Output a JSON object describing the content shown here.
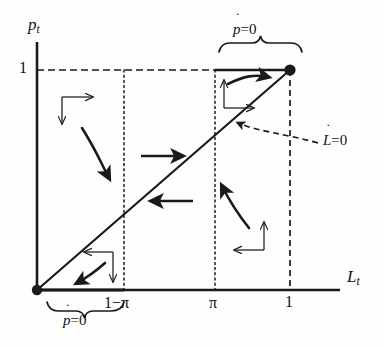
{
  "figure": {
    "type": "phase-diagram",
    "axes": {
      "x_label": "L",
      "x_label_sub": "t",
      "y_label": "p",
      "y_label_sub": "t"
    },
    "x_ticks": [
      {
        "label": "1−π",
        "value": "1-pi"
      },
      {
        "label": "π",
        "value": "pi"
      },
      {
        "label": "1",
        "value": "1"
      }
    ],
    "y_ticks": [
      {
        "label": "1",
        "value": "1"
      }
    ],
    "annotations": {
      "p_dot_top": {
        "base": "p",
        "dot": "˙",
        "rest": "=0"
      },
      "p_dot_bottom": {
        "base": "p",
        "dot": "˙",
        "rest": "=0"
      },
      "l_dot": {
        "base": "L",
        "dot": "˙",
        "rest": "=0"
      }
    },
    "nodes": [
      {
        "name": "origin-node",
        "x": "0",
        "y": "0"
      },
      {
        "name": "upper-node",
        "x": "1",
        "y": "1"
      }
    ],
    "isoclines": [
      {
        "name": "l-dot-zero-diagonal",
        "style": "solid",
        "from": "(0,0)",
        "to": "(1,1)"
      },
      {
        "name": "p-dot-zero-top-segment",
        "style": "solid",
        "from": "(pi,1)",
        "to": "(1,1)"
      },
      {
        "name": "p-dot-zero-bottom-segment",
        "style": "solid",
        "from": "(0,0)",
        "to": "(1-pi,0)"
      }
    ],
    "guides": [
      {
        "name": "p-equals-one-dashed",
        "style": "dashed",
        "orientation": "horizontal"
      },
      {
        "name": "x-equals-one-minus-pi",
        "style": "dotted",
        "orientation": "vertical"
      },
      {
        "name": "x-equals-pi",
        "style": "dotted",
        "orientation": "vertical"
      },
      {
        "name": "x-equals-one",
        "style": "dashed",
        "orientation": "vertical"
      }
    ],
    "flow_arrows": [
      {
        "name": "flow-arrow-top-left",
        "region": "upper-left",
        "direction": "down-right"
      },
      {
        "name": "flow-arrow-top-right",
        "region": "upper-right",
        "direction": "up-right"
      },
      {
        "name": "flow-arrow-bottom-right",
        "region": "lower-right",
        "direction": "up-left"
      },
      {
        "name": "flow-arrow-bottom-left",
        "region": "lower-left",
        "direction": "down-left"
      },
      {
        "name": "flow-arrow-middle-upper",
        "region": "middle-above-diagonal",
        "direction": "right"
      },
      {
        "name": "flow-arrow-middle-lower",
        "region": "middle-below-diagonal",
        "direction": "left"
      }
    ],
    "direction_crosses": [
      {
        "name": "cross-upper-left",
        "arrows": [
          "right",
          "down"
        ]
      },
      {
        "name": "cross-upper-right",
        "arrows": [
          "up",
          "right"
        ]
      },
      {
        "name": "cross-lower-right",
        "arrows": [
          "left",
          "up"
        ]
      },
      {
        "name": "cross-lower-left",
        "arrows": [
          "left",
          "down"
        ]
      }
    ],
    "braces": [
      {
        "name": "brace-top",
        "label_ref": "p_dot_top",
        "orientation": "up"
      },
      {
        "name": "brace-bottom",
        "label_ref": "p_dot_bottom",
        "orientation": "down"
      }
    ],
    "colors": {
      "ink": "#1a1a1a",
      "background": "#ffffff"
    }
  }
}
